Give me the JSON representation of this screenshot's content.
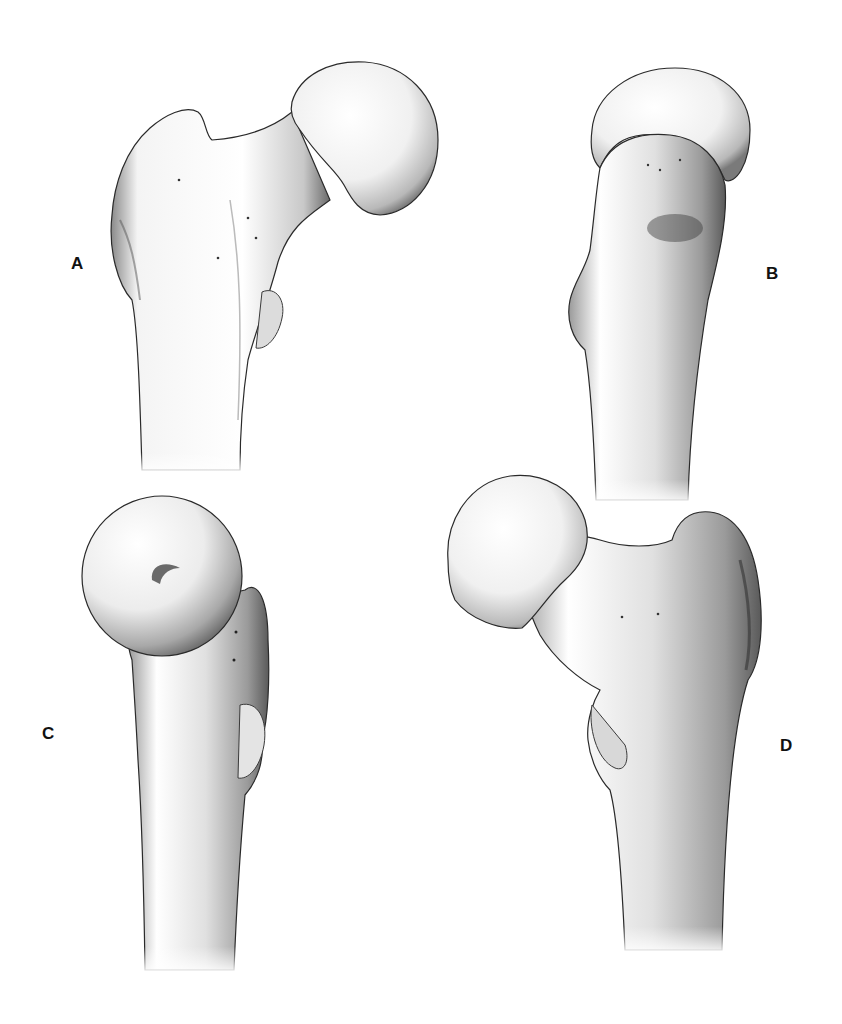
{
  "figure": {
    "background": "#ffffff",
    "ink": "#111111",
    "panels": [
      {
        "id": "A",
        "label": "A",
        "label_pos": [
          71,
          255
        ],
        "description": "Anterior view of proximal femur (head to upper right)"
      },
      {
        "id": "B",
        "label": "B",
        "label_pos": [
          766,
          265
        ],
        "description": "Lateral/medial view, head seen edge-on above shaft"
      },
      {
        "id": "C",
        "label": "C",
        "label_pos": [
          42,
          725
        ],
        "description": "Superomedial view with femoral head facing viewer, fovea visible"
      },
      {
        "id": "D",
        "label": "D",
        "label_pos": [
          780,
          737
        ],
        "description": "Posterior view of proximal femur (head to upper left)"
      }
    ]
  }
}
